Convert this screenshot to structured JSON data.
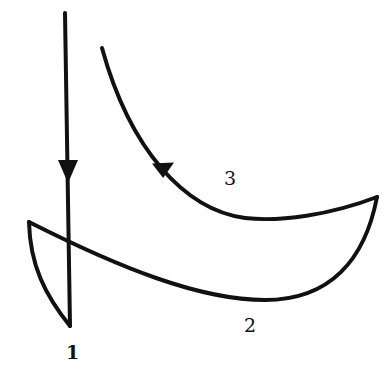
{
  "diagram": {
    "labels": {
      "one": "1",
      "two": "2",
      "three": "3"
    },
    "stroke_color": "#111111",
    "background": "#ffffff",
    "paths": [
      {
        "name": "path-1",
        "description": "vertical descending line with downward arrow, closing into left loop"
      },
      {
        "name": "path-2",
        "description": "lower curve from left tip to right tip"
      },
      {
        "name": "path-3",
        "description": "upper curve from right tip rising to upper left with arrow"
      }
    ]
  }
}
